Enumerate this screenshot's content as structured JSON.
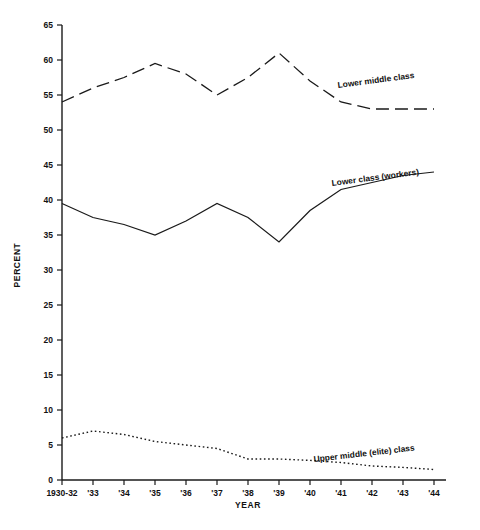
{
  "chart_data": {
    "type": "line",
    "title": "",
    "subtitle": "",
    "xlabel": "YEAR",
    "ylabel": "PERCENT",
    "categories": [
      "1930-32",
      "'33",
      "'34",
      "'35",
      "'36",
      "'37",
      "'38",
      "'39",
      "'40",
      "'41",
      "'42",
      "'43",
      "'44"
    ],
    "xtick_labels": [
      "1930-32",
      "'33",
      "'34",
      "'35",
      "'36",
      "'37",
      "'38",
      "'39",
      "'40",
      "'41",
      "'42",
      "'43",
      "'44"
    ],
    "ytick_labels": [
      "0",
      "5",
      "10",
      "15",
      "20",
      "25",
      "30",
      "35",
      "40",
      "45",
      "50",
      "55",
      "60",
      "65"
    ],
    "ytick_values": [
      0,
      5,
      10,
      15,
      20,
      25,
      30,
      35,
      40,
      45,
      50,
      55,
      60,
      65
    ],
    "ylim": [
      0,
      65
    ],
    "grid": false,
    "legend_position": "inline-annotations",
    "series": [
      {
        "name": "Lower middle class",
        "style": "dashed",
        "values": [
          54,
          56,
          57.5,
          59.5,
          58,
          55,
          57.5,
          61,
          57,
          54,
          53,
          53,
          53
        ],
        "annotation": "Lower middle class"
      },
      {
        "name": "Lower class (workers)",
        "style": "solid",
        "values": [
          39.5,
          37.5,
          36.5,
          35,
          37,
          39.5,
          37.5,
          34,
          38.5,
          41.5,
          42.5,
          43.5,
          44
        ],
        "annotation": "Lower class (workers)"
      },
      {
        "name": "Upper middle (elite) class",
        "style": "dotted",
        "values": [
          6,
          7,
          6.5,
          5.5,
          5,
          4.5,
          3,
          3,
          2.8,
          2.5,
          2,
          1.8,
          1.5
        ],
        "annotation": "Upper middle (elite) class"
      }
    ],
    "annotations": [
      {
        "text": "Lower middle class",
        "series": "Lower middle class"
      },
      {
        "text": "Lower class (workers)",
        "series": "Lower class (workers)"
      },
      {
        "text": "Upper middle (elite) class",
        "series": "Upper middle (elite) class"
      }
    ]
  }
}
